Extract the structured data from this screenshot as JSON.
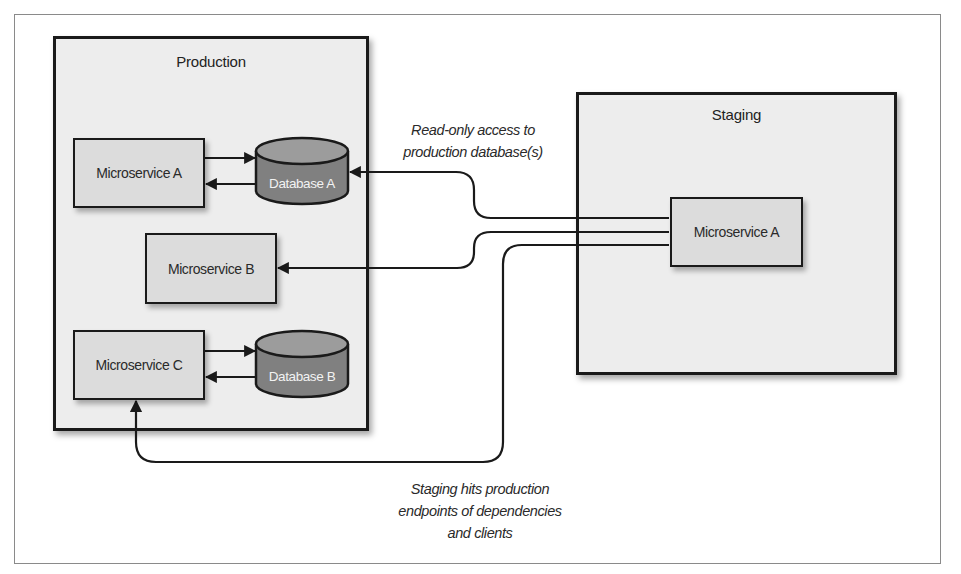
{
  "diagram": {
    "environments": [
      {
        "id": "production",
        "label": "Production",
        "services": [
          {
            "id": "microservice-a",
            "label": "Microservice A"
          },
          {
            "id": "microservice-b",
            "label": "Microservice B"
          },
          {
            "id": "microservice-c",
            "label": "Microservice C"
          }
        ],
        "databases": [
          {
            "id": "database-a",
            "label": "Database A"
          },
          {
            "id": "database-b",
            "label": "Database B"
          }
        ]
      },
      {
        "id": "staging",
        "label": "Staging",
        "services": [
          {
            "id": "staging-microservice-a",
            "label": "Microservice A"
          }
        ]
      }
    ],
    "annotations": {
      "read_only": [
        "Read-only access to",
        "production database(s)"
      ],
      "staging_hits": [
        "Staging hits production",
        "endpoints of dependencies",
        "and clients"
      ]
    },
    "edges": [
      {
        "from": "production.microservice-a",
        "to": "production.database-a",
        "direction": "bidirectional"
      },
      {
        "from": "production.microservice-c",
        "to": "production.database-b",
        "direction": "bidirectional"
      },
      {
        "from": "staging.microservice-a",
        "to": "production.database-a",
        "label": "read-only"
      },
      {
        "from": "staging.microservice-a",
        "to": "production.microservice-b"
      },
      {
        "from": "staging.microservice-a",
        "to": "production.microservice-c"
      }
    ],
    "colors": {
      "environment_fill": "#ededed",
      "service_fill": "#dcdcdc",
      "database_top": "#9a9a9a",
      "database_body": "#808080",
      "line": "#1a1a1a"
    }
  }
}
